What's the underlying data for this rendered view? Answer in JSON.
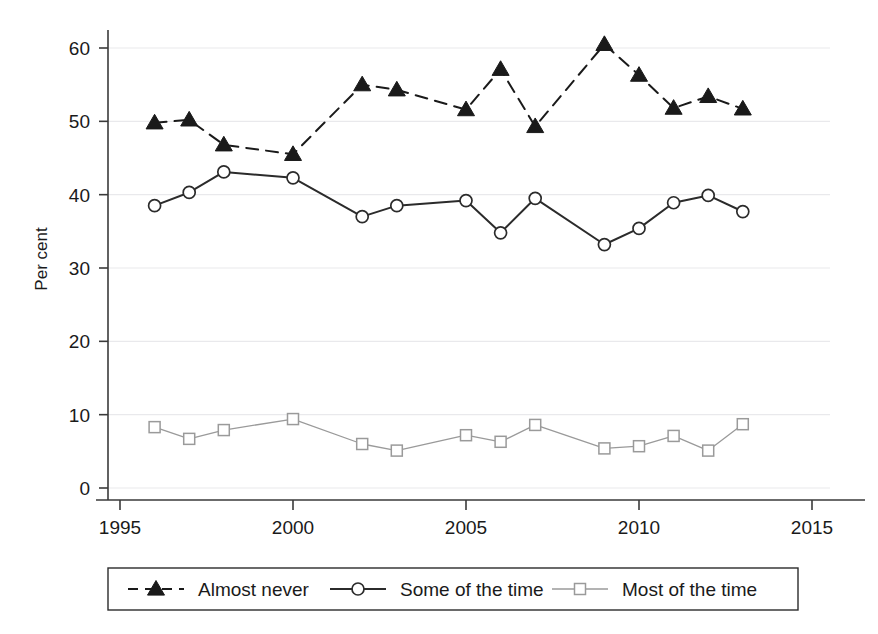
{
  "chart_data": {
    "type": "line",
    "title": "",
    "subtitle": "",
    "xlabel": "",
    "ylabel": "Per cent",
    "xlim": [
      1995,
      2015
    ],
    "ylim": [
      0,
      62
    ],
    "xticks": [
      1995,
      2000,
      2005,
      2010,
      2015
    ],
    "yticks": [
      0,
      10,
      20,
      30,
      40,
      50,
      60
    ],
    "grid": true,
    "legend_position": "bottom",
    "x": [
      1996,
      1997,
      1998,
      2000,
      2002,
      2003,
      2005,
      2006,
      2007,
      2009,
      2010,
      2011,
      2012,
      2013
    ],
    "series": [
      {
        "name": "Almost never",
        "marker": "filled-triangle",
        "linestyle": "dashed",
        "color": "#1a1a1a",
        "values": [
          49.8,
          50.2,
          46.8,
          45.5,
          55.0,
          54.3,
          51.6,
          57.1,
          49.3,
          60.5,
          56.3,
          51.8,
          53.4,
          51.7
        ]
      },
      {
        "name": "Some of the time",
        "marker": "open-circle",
        "linestyle": "solid",
        "color": "#2b2b2b",
        "values": [
          38.5,
          40.3,
          43.1,
          42.3,
          37.0,
          38.5,
          39.2,
          34.8,
          39.5,
          33.2,
          35.4,
          38.9,
          39.9,
          37.7
        ]
      },
      {
        "name": "Most of the time",
        "marker": "open-square",
        "linestyle": "solid-light",
        "color": "#9a9a9a",
        "values": [
          8.3,
          6.7,
          7.9,
          9.4,
          6.0,
          5.1,
          7.2,
          6.3,
          8.6,
          5.4,
          5.7,
          7.1,
          5.1,
          8.7
        ]
      }
    ]
  },
  "legend": {
    "items": [
      {
        "label": "Almost never"
      },
      {
        "label": "Some of the time"
      },
      {
        "label": "Most of the time"
      }
    ]
  },
  "axes": {
    "y_title": "Per cent",
    "y_tick_labels": [
      "0",
      "10",
      "20",
      "30",
      "40",
      "50",
      "60"
    ],
    "x_tick_labels": [
      "1995",
      "2000",
      "2005",
      "2010",
      "2015"
    ]
  }
}
